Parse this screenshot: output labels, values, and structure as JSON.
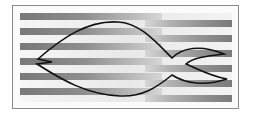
{
  "figure": {
    "colors": {
      "frame_border": "#8a8a8a",
      "background": "#fbfbfb",
      "stripe_dark": "#7d7d7d",
      "stripe_mid": "#a9a9a9",
      "stripe_light": "#d2d2d2",
      "outline": "#111111"
    },
    "stripes": {
      "left_phase_rows_y": [
        13,
        28,
        43,
        58,
        73,
        88
      ],
      "right_phase_rows_y": [
        20,
        35,
        50,
        65,
        80,
        95
      ],
      "row_height": 7,
      "area": {
        "x": 20,
        "y": 13,
        "width": 212,
        "height": 89
      }
    },
    "fish": {
      "outline_path": "M38,59 C62,38 88,20 118,22 C140,23 156,42 172,58 C182,48 200,44 224,54 C206,56 192,58 186,64 C196,68 210,76 227,79 C206,86 186,84 172,75 C156,88 142,97 120,96 C88,95 62,80 37,64 L52,62 Z"
    }
  }
}
